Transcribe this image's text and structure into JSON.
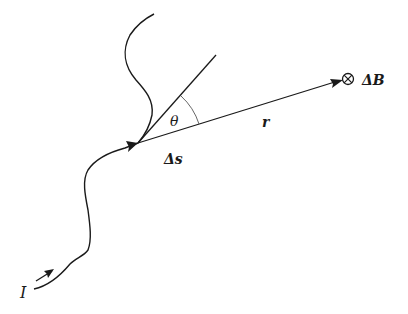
{
  "diagram": {
    "type": "Biot-Savart law geometry",
    "labels": {
      "current": "I",
      "segment": "Δs",
      "vector": "r",
      "angle": "θ",
      "field": "ΔB",
      "field_symbol": "⊗"
    },
    "elements": [
      {
        "name": "current-carrying-wire",
        "description": "curved wire with current direction arrows"
      },
      {
        "name": "tangent-line",
        "description": "tangent to wire at segment Δs"
      },
      {
        "name": "position-vector-r",
        "description": "arrow from Δs to field point"
      },
      {
        "name": "angle-arc",
        "description": "angle θ between tangent and r"
      },
      {
        "name": "field-point",
        "description": "ΔB directed into the page (⊗)"
      }
    ],
    "colors": {
      "stroke": "#1a1a1a",
      "background": "#ffffff"
    }
  }
}
